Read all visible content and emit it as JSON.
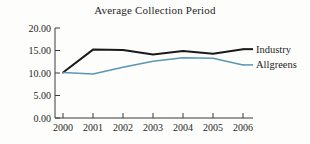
{
  "chart_data": {
    "type": "line",
    "title": "Average Collection Period",
    "xlabel": "",
    "ylabel": "",
    "categories": [
      "2000",
      "2001",
      "2002",
      "2003",
      "2004",
      "2005",
      "2006"
    ],
    "x": [
      2000,
      2001,
      2002,
      2003,
      2004,
      2005,
      2006
    ],
    "ylim": [
      0,
      20
    ],
    "yticks": [
      0,
      5,
      10,
      15,
      20
    ],
    "ytick_labels": [
      "0.00",
      "5.00",
      "10.00",
      "15.00",
      "20.00"
    ],
    "grid": false,
    "legend_position": "right-inline",
    "series": [
      {
        "name": "Industry",
        "color": "#1a1a1a",
        "values": [
          10.1,
          15.2,
          15.1,
          14.1,
          14.9,
          14.3,
          15.3
        ]
      },
      {
        "name": "Allgreens",
        "color": "#5b96b4",
        "values": [
          10.1,
          9.8,
          11.3,
          12.6,
          13.4,
          13.3,
          11.8
        ]
      }
    ]
  }
}
